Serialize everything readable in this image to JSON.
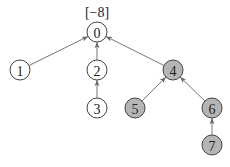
{
  "diagram": {
    "type": "tree",
    "root_label": "[−8]",
    "colors": {
      "white_node": "#ffffff",
      "gray_node": "#b5b5b5",
      "stroke": "#444444",
      "edge": "#666666"
    },
    "nodes": [
      {
        "id": "0",
        "label": "0",
        "x": 97,
        "y": 32,
        "fill": "white"
      },
      {
        "id": "1",
        "label": "1",
        "x": 20,
        "y": 70,
        "fill": "white"
      },
      {
        "id": "2",
        "label": "2",
        "x": 97,
        "y": 70,
        "fill": "white"
      },
      {
        "id": "3",
        "label": "3",
        "x": 97,
        "y": 108,
        "fill": "white"
      },
      {
        "id": "4",
        "label": "4",
        "x": 173,
        "y": 70,
        "fill": "gray"
      },
      {
        "id": "5",
        "label": "5",
        "x": 135,
        "y": 108,
        "fill": "gray"
      },
      {
        "id": "6",
        "label": "6",
        "x": 212,
        "y": 108,
        "fill": "gray"
      },
      {
        "id": "7",
        "label": "7",
        "x": 212,
        "y": 145,
        "fill": "gray"
      }
    ],
    "edges": [
      {
        "from": "1",
        "to": "0"
      },
      {
        "from": "2",
        "to": "0"
      },
      {
        "from": "4",
        "to": "0"
      },
      {
        "from": "3",
        "to": "2"
      },
      {
        "from": "5",
        "to": "4"
      },
      {
        "from": "6",
        "to": "4"
      },
      {
        "from": "7",
        "to": "6"
      }
    ]
  }
}
